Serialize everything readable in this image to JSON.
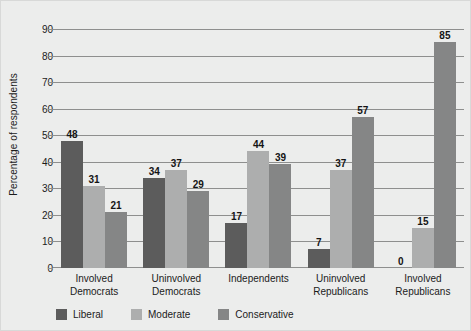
{
  "chart_data": {
    "type": "bar",
    "title": "",
    "xlabel": "",
    "ylabel": "Percentage of respondents",
    "ylim": [
      0,
      90
    ],
    "yticks": [
      0,
      10,
      20,
      30,
      40,
      50,
      60,
      70,
      80,
      90
    ],
    "grid": true,
    "legend_position": "bottom-left",
    "categories": [
      "Involved Democrats",
      "Uninvolved Democrats",
      "Independents",
      "Uninvolved Republicans",
      "Involved Republicans"
    ],
    "category_lines": [
      [
        "Involved",
        "Democrats"
      ],
      [
        "Uninvolved",
        "Democrats"
      ],
      [
        "Independents",
        ""
      ],
      [
        "Uninvolved",
        "Republicans"
      ],
      [
        "Involved",
        "Republicans"
      ]
    ],
    "series": [
      {
        "name": "Liberal",
        "color": "#5c5c5c",
        "values": [
          48,
          34,
          17,
          7,
          0
        ]
      },
      {
        "name": "Moderate",
        "color": "#adaeae",
        "values": [
          31,
          37,
          44,
          37,
          15
        ]
      },
      {
        "name": "Conservative",
        "color": "#858686",
        "values": [
          21,
          29,
          39,
          57,
          85
        ]
      }
    ]
  },
  "colors": {
    "background": "#ecedec",
    "gridline": "#8e8f8e",
    "text": "#1b1b1b"
  }
}
